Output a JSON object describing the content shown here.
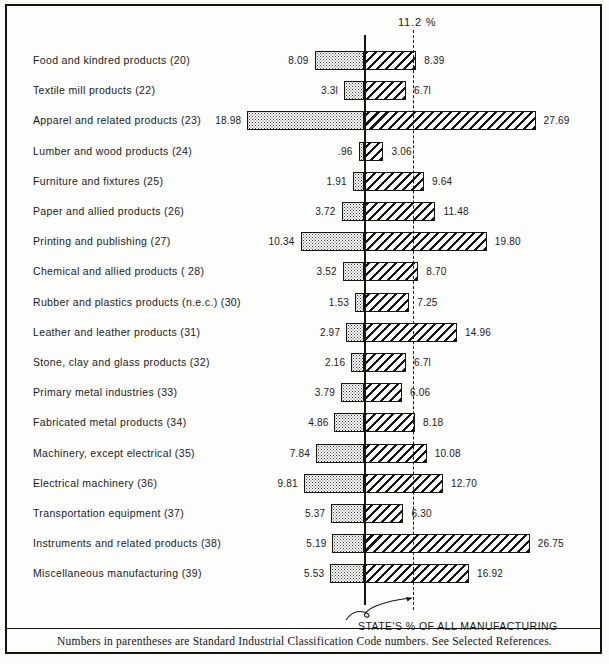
{
  "figure": {
    "state_line_label": "11.2 %",
    "annotation": "STATE'S % OF ALL MANUFACTURING",
    "footnote": "Numbers in parentheses are Standard Industrial Classification Code numbers.  See Selected References."
  },
  "chart_data": {
    "type": "bar",
    "orientation": "horizontal",
    "subtype": "diverging-paired-bar",
    "title": "",
    "xlabel": "",
    "ylabel": "",
    "reference_line": {
      "label": "11.2 %",
      "value": 11.2,
      "style": "dashed",
      "note": "STATE'S % OF ALL MANUFACTURING"
    },
    "zero_axis": 0,
    "xlim": [
      -19.5,
      28.5
    ],
    "grid": false,
    "legend_position": "none",
    "categories": [
      "Food and kindred products (20)",
      "Textile mill products (22)",
      "Apparel and related products (23)",
      "Lumber and  wood products (24)",
      "Furniture and fixtures (25)",
      "Paper and allied products (26)",
      "Printing and publishing (27)",
      "Chemical and allied products ( 28)",
      "Rubber and  plastics products (n.e.c.) (30)",
      "Leather and leather products (31)",
      "Stone, clay and glass products (32)",
      "Primary metal industries (33)",
      "Fabricated metal products (34)",
      "Machinery, except electrical (35)",
      "Electrical machinery (36)",
      "Transportation equipment (37)",
      "Instruments and related products (38)",
      "Miscellaneous manufacturing (39)"
    ],
    "series": [
      {
        "name": "left",
        "values": [
          8.09,
          3.31,
          18.98,
          0.96,
          1.91,
          3.72,
          10.34,
          3.52,
          1.53,
          2.97,
          2.16,
          3.79,
          4.86,
          7.84,
          9.81,
          5.37,
          5.19,
          5.53
        ]
      },
      {
        "name": "right",
        "values": [
          8.39,
          6.71,
          27.69,
          3.06,
          9.64,
          11.48,
          19.8,
          8.7,
          7.25,
          14.96,
          6.71,
          6.06,
          8.18,
          10.08,
          12.7,
          6.3,
          26.75,
          16.92
        ]
      }
    ],
    "left_labels": [
      "8.09",
      "3.3l",
      "18.98",
      ".96",
      "1.91",
      "3.72",
      "10.34",
      "3.52",
      "1.53",
      "2.97",
      "2.16",
      "3.79",
      "4.86",
      "7.84",
      "9.81",
      "5.37",
      "5.19",
      "5.53"
    ],
    "right_labels": [
      "8.39",
      "6.7l",
      "27.69",
      "3.06",
      "9.64",
      "11.48",
      "19.80",
      "8.70",
      "7.25",
      "14.96",
      "6.7l",
      "6.06",
      "8.18",
      "10.08",
      "12.70",
      "6.30",
      "26.75",
      "16.92"
    ]
  },
  "rows": [
    {
      "label": "Food and kindred products (20)",
      "left": 8.09,
      "right": 8.39,
      "left_label": "8.09",
      "right_label": "8.39"
    },
    {
      "label": "Textile mill products (22)",
      "left": 3.31,
      "right": 6.71,
      "left_label": "3.3l",
      "right_label": "6.7l"
    },
    {
      "label": "Apparel and related products (23)",
      "left": 18.98,
      "right": 27.69,
      "left_label": "18.98",
      "right_label": "27.69"
    },
    {
      "label": "Lumber and  wood products (24)",
      "left": 0.96,
      "right": 3.06,
      "left_label": ".96",
      "right_label": "3.06"
    },
    {
      "label": "Furniture and fixtures (25)",
      "left": 1.91,
      "right": 9.64,
      "left_label": "1.91",
      "right_label": "9.64"
    },
    {
      "label": "Paper and allied products (26)",
      "left": 3.72,
      "right": 11.48,
      "left_label": "3.72",
      "right_label": "11.48"
    },
    {
      "label": "Printing and publishing (27)",
      "left": 10.34,
      "right": 19.8,
      "left_label": "10.34",
      "right_label": "19.80"
    },
    {
      "label": "Chemical and allied products ( 28)",
      "left": 3.52,
      "right": 8.7,
      "left_label": "3.52",
      "right_label": "8.70"
    },
    {
      "label": "Rubber and  plastics products (n.e.c.) (30)",
      "left": 1.53,
      "right": 7.25,
      "left_label": "1.53",
      "right_label": "7.25"
    },
    {
      "label": "Leather and leather products (31)",
      "left": 2.97,
      "right": 14.96,
      "left_label": "2.97",
      "right_label": "14.96"
    },
    {
      "label": "Stone, clay and glass products (32)",
      "left": 2.16,
      "right": 6.71,
      "left_label": "2.16",
      "right_label": "6.7l"
    },
    {
      "label": "Primary metal industries (33)",
      "left": 3.79,
      "right": 6.06,
      "left_label": "3.79",
      "right_label": "6.06"
    },
    {
      "label": "Fabricated metal products (34)",
      "left": 4.86,
      "right": 8.18,
      "left_label": "4.86",
      "right_label": "8.18"
    },
    {
      "label": "Machinery, except electrical (35)",
      "left": 7.84,
      "right": 10.08,
      "left_label": "7.84",
      "right_label": "10.08"
    },
    {
      "label": "Electrical machinery (36)",
      "left": 9.81,
      "right": 12.7,
      "left_label": "9.81",
      "right_label": "12.70"
    },
    {
      "label": "Transportation equipment (37)",
      "left": 5.37,
      "right": 6.3,
      "left_label": "5.37",
      "right_label": "6.30"
    },
    {
      "label": "Instruments and related products (38)",
      "left": 5.19,
      "right": 26.75,
      "left_label": "5.19",
      "right_label": "26.75"
    },
    {
      "label": "Miscellaneous manufacturing (39)",
      "left": 5.53,
      "right": 16.92,
      "left_label": "5.53",
      "right_label": "16.92"
    }
  ]
}
